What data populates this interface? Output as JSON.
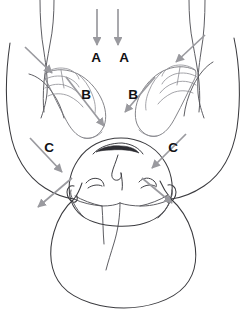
{
  "figure": {
    "canvas": {
      "width": 247,
      "height": 309
    },
    "colors": {
      "background": "#ffffff",
      "body_outline": "#3b3b3f",
      "hand_outline": "#76767c",
      "arrow": "#9a9a9f",
      "label_text": "#111114"
    }
  },
  "labels": [
    {
      "id": "label-a-left",
      "text": "A",
      "x": 96,
      "y": 58
    },
    {
      "id": "label-a-right",
      "text": "A",
      "x": 124,
      "y": 58
    },
    {
      "id": "label-b-left",
      "text": "B",
      "x": 86,
      "y": 95
    },
    {
      "id": "label-b-right",
      "text": "B",
      "x": 133,
      "y": 95
    },
    {
      "id": "label-c-left",
      "text": "C",
      "x": 49,
      "y": 148
    },
    {
      "id": "label-c-right",
      "text": "C",
      "x": 173,
      "y": 148
    }
  ],
  "arrows": [
    {
      "id": "arrow-a-left",
      "label": "A",
      "direction": "down",
      "description": "Vertical downward arrow above the left A label",
      "from": {
        "x": 97,
        "y": 9
      },
      "to": {
        "x": 97,
        "y": 45
      }
    },
    {
      "id": "arrow-a-right",
      "label": "A",
      "direction": "down",
      "description": "Vertical downward arrow above the right A label",
      "from": {
        "x": 118,
        "y": 9
      },
      "to": {
        "x": 118,
        "y": 45
      }
    },
    {
      "id": "arrow-b-left",
      "label": "B",
      "direction": "down-right",
      "description": "Diagonal arrow from left hand toward the midline",
      "from": {
        "x": 66,
        "y": 77
      },
      "to": {
        "x": 104,
        "y": 126
      }
    },
    {
      "id": "arrow-b-right",
      "label": "B",
      "direction": "down-left",
      "description": "Diagonal arrow from right hand toward the midline",
      "from": {
        "x": 155,
        "y": 77
      },
      "to": {
        "x": 125,
        "y": 112
      }
    },
    {
      "id": "arrow-c-left",
      "label": "C",
      "direction": "down-right",
      "description": "Diagonal arrow from upper-left toward the left jaw",
      "from": {
        "x": 30,
        "y": 138
      },
      "to": {
        "x": 62,
        "y": 172
      }
    },
    {
      "id": "arrow-c-right",
      "label": "C",
      "direction": "down-left",
      "description": "Diagonal arrow from upper-right toward the right jaw",
      "from": {
        "x": 186,
        "y": 134
      },
      "to": {
        "x": 152,
        "y": 168
      }
    },
    {
      "id": "arrow-outward-left",
      "label": "",
      "direction": "down-left",
      "description": "Outward arrow from the left jaw toward lower-left",
      "from": {
        "x": 72,
        "y": 178
      },
      "to": {
        "x": 38,
        "y": 207
      }
    },
    {
      "id": "arrow-outward-right",
      "label": "",
      "direction": "down-right",
      "description": "Outward arrow from the right jaw toward lower-right",
      "from": {
        "x": 142,
        "y": 178
      },
      "to": {
        "x": 172,
        "y": 203
      }
    },
    {
      "id": "arrow-shoulder-left",
      "label": "",
      "direction": "down-right",
      "description": "Short diagonal arrow into the left shoulder region",
      "from": {
        "x": 25,
        "y": 47
      },
      "to": {
        "x": 52,
        "y": 73
      }
    },
    {
      "id": "arrow-shoulder-right",
      "label": "",
      "direction": "down-left",
      "description": "Short diagonal arrow into the right shoulder region",
      "from": {
        "x": 205,
        "y": 35
      },
      "to": {
        "x": 176,
        "y": 62
      }
    }
  ],
  "anatomy": [
    {
      "id": "head-outline",
      "name": "head-outline",
      "description": "Inverted oval head contour"
    },
    {
      "id": "mouth",
      "name": "mouth",
      "description": "Open mouth rendered at the top of the inverted face"
    },
    {
      "id": "nose",
      "name": "nose",
      "description": "Nose below the mouth in the inverted view"
    },
    {
      "id": "eye-left",
      "name": "eye-left",
      "description": "Closed left eye"
    },
    {
      "id": "eye-right",
      "name": "eye-right",
      "description": "Closed right eye"
    },
    {
      "id": "ear-left",
      "name": "ear-left",
      "description": "Left ear at the side of the head"
    },
    {
      "id": "ear-right",
      "name": "ear-right",
      "description": "Right ear at the side of the head"
    },
    {
      "id": "neck",
      "name": "neck",
      "description": "Neck joining head to torso"
    },
    {
      "id": "torso",
      "name": "torso",
      "description": "Rounded upper torso / chest mass"
    },
    {
      "id": "arm-left",
      "name": "arm-left",
      "description": "Left arm and shoulder contour"
    },
    {
      "id": "arm-right",
      "name": "arm-right",
      "description": "Right arm and shoulder contour"
    },
    {
      "id": "hand-left",
      "name": "hand-left",
      "description": "Left operator hand with fingers angled up-left"
    },
    {
      "id": "hand-right",
      "name": "hand-right",
      "description": "Right operator hand with fingers angled up-right"
    }
  ]
}
